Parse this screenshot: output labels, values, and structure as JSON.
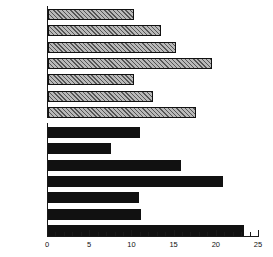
{
  "chart_data": {
    "type": "bar",
    "orientation": "horizontal",
    "title": "",
    "xlabel": "",
    "ylabel": "",
    "xlim": [
      0,
      25
    ],
    "xticks": [
      0,
      5,
      10,
      15,
      20,
      25
    ],
    "xtick_labels": [
      "0",
      "5",
      "10",
      "15",
      "20",
      "25"
    ],
    "minor_tick_step": 1,
    "grid": false,
    "legend": "none",
    "categories": [
      "Very great",
      "6",
      "5",
      "4",
      "3",
      "2",
      "None"
    ],
    "series": [
      {
        "name": "hatched",
        "fill": "hatched",
        "color": "#b9b9b9",
        "values": [
          10.2,
          13.4,
          15.2,
          19.4,
          10.2,
          12.4,
          17.5
        ]
      },
      {
        "name": "solid",
        "fill": "solid",
        "color": "#111111",
        "values": [
          10.9,
          7.5,
          15.8,
          20.7,
          10.8,
          11.0,
          23.2
        ]
      }
    ]
  },
  "axis": {
    "x_min_px": 47,
    "x_max_px": 258,
    "px_per_unit": 8.44
  }
}
